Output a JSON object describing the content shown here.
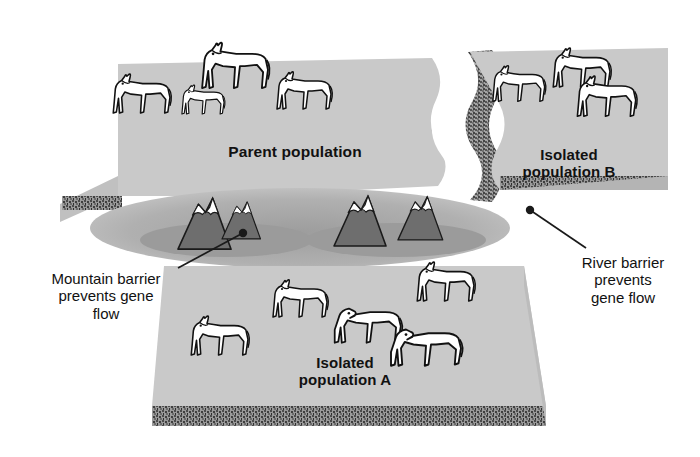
{
  "diagram": {
    "background_color": "#ffffff",
    "platform_color": "#c9c9c9",
    "platform_shade_color": "#bdbdbd",
    "haze_color": "#a8a8a8",
    "mountain_color": "#6e6e6e",
    "mountain_snow_color": "#ffffff",
    "soil_band_color": "#8a8a8a",
    "soil_speck_color": "#4a4a4a",
    "animal_fill": "#ffffff",
    "outline_color": "#111111",
    "river_color": "#ffffff",
    "text_color": "#111111"
  },
  "labels": {
    "parent_population": "Parent population",
    "isolated_population_b": "Isolated\npopulation B",
    "isolated_population_a": "Isolated\npopulation A",
    "mountain_barrier": "Mountain barrier\nprevents gene\nflow",
    "river_barrier": "River barrier\nprevents\ngene flow"
  },
  "regions": [
    {
      "name": "parent-population-platform",
      "label": "Parent population",
      "animal_count": 4,
      "barrier": "none"
    },
    {
      "name": "isolated-population-b-platform",
      "label": "Isolated population B",
      "animal_count": 3,
      "barrier": "river"
    },
    {
      "name": "isolated-population-a-platform",
      "label": "Isolated population A",
      "animal_count": 5,
      "barrier": "mountain"
    }
  ],
  "barriers": [
    {
      "name": "mountain-barrier",
      "kind": "mountain",
      "caption": "Mountain barrier prevents gene flow",
      "peak_count": 4,
      "separates": [
        "Parent population",
        "Isolated population A"
      ]
    },
    {
      "name": "river-barrier",
      "kind": "river",
      "caption": "River barrier prevents gene flow",
      "separates": [
        "Parent population",
        "Isolated population B"
      ]
    }
  ],
  "callouts": [
    {
      "name": "mountain-barrier-callout",
      "text": "Mountain barrier\nprevents gene\nflow",
      "dot_x": 243,
      "dot_y": 233,
      "line_to_x": 178,
      "line_to_y": 268
    },
    {
      "name": "river-barrier-callout",
      "text": "River barrier\nprevents\ngene flow",
      "dot_x": 530,
      "dot_y": 210,
      "line_to_x": 586,
      "line_to_y": 248
    }
  ]
}
